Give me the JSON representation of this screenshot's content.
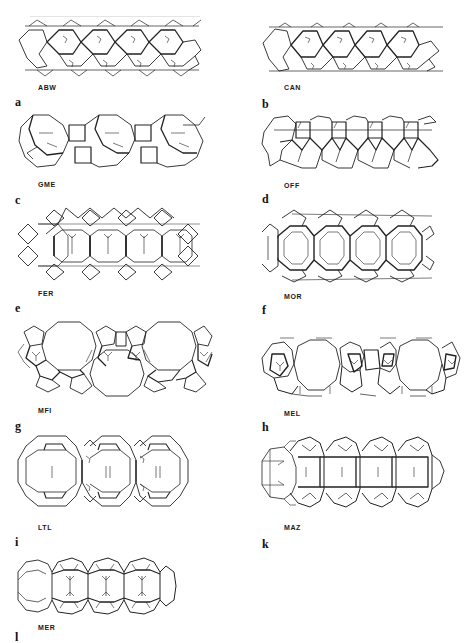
{
  "figure": {
    "colors": {
      "line": "#222222",
      "thin_line": "#444444",
      "background": "#ffffff"
    },
    "panels": [
      {
        "letter": "a",
        "code": "ABW",
        "column": "left",
        "motif": "hexagon-chain"
      },
      {
        "letter": "b",
        "code": "CAN",
        "column": "right",
        "motif": "hexagon-chain"
      },
      {
        "letter": "c",
        "code": "GME",
        "column": "left",
        "motif": "cage-square-chain"
      },
      {
        "letter": "d",
        "code": "OFF",
        "column": "right",
        "motif": "cage-square-chain"
      },
      {
        "letter": "e",
        "code": "FER",
        "column": "left",
        "motif": "octagon-diamond-chain"
      },
      {
        "letter": "f",
        "code": "MOR",
        "column": "right",
        "motif": "octagon-diamond-chain"
      },
      {
        "letter": "g",
        "code": "MFI",
        "column": "left",
        "motif": "ten-ring-pentasil"
      },
      {
        "letter": "h",
        "code": "MEL",
        "column": "right",
        "motif": "ten-ring-pentasil"
      },
      {
        "letter": "i",
        "code": "LTL",
        "column": "left",
        "motif": "cylindrical-cages"
      },
      {
        "letter": "k",
        "code": "MAZ",
        "column": "right",
        "motif": "cylindrical-cages"
      },
      {
        "letter": "l",
        "code": "MER",
        "column": "left",
        "motif": "cylindrical-cages"
      }
    ]
  }
}
